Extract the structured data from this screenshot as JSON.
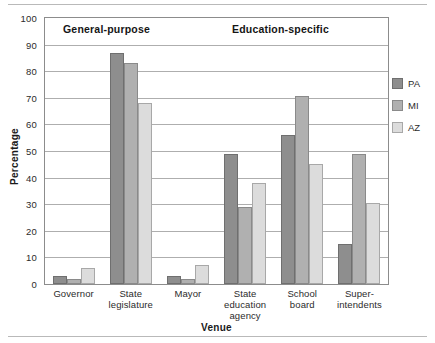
{
  "chart_data": {
    "type": "bar",
    "title": "",
    "xlabel": "Venue",
    "ylabel": "Percentage",
    "ylim": [
      0,
      100
    ],
    "ytick_step": 10,
    "yticks": [
      100,
      90,
      80,
      70,
      60,
      50,
      40,
      30,
      20,
      10,
      0
    ],
    "grid": true,
    "legend_position": "right",
    "categories": [
      "Governor",
      "State legislature",
      "Mayor",
      "State education agency",
      "School board",
      "Super-intendents"
    ],
    "category_lines": [
      [
        "Governor"
      ],
      [
        "State",
        "legislature"
      ],
      [
        "Mayor"
      ],
      [
        "State",
        "education",
        "agency"
      ],
      [
        "School",
        "board"
      ],
      [
        "Super-",
        "intendents"
      ]
    ],
    "series": [
      {
        "name": "PA",
        "color": "#8e8e8e",
        "values": [
          3,
          87,
          3,
          49,
          56,
          15
        ]
      },
      {
        "name": "MI",
        "color": "#b0b0b0",
        "values": [
          2,
          83,
          2,
          29,
          70.5,
          49
        ]
      },
      {
        "name": "AZ",
        "color": "#dcdcdc",
        "values": [
          6,
          68,
          7,
          38,
          45,
          30.5
        ]
      }
    ],
    "annotations": [
      {
        "text": "General-purpose",
        "covers": [
          "Governor",
          "State legislature",
          "Mayor"
        ]
      },
      {
        "text": "Education-specific",
        "covers": [
          "State education agency",
          "School board",
          "Super-intendents"
        ]
      }
    ]
  },
  "legend": {
    "entries": [
      {
        "label": "PA"
      },
      {
        "label": "MI"
      },
      {
        "label": "AZ"
      }
    ]
  }
}
